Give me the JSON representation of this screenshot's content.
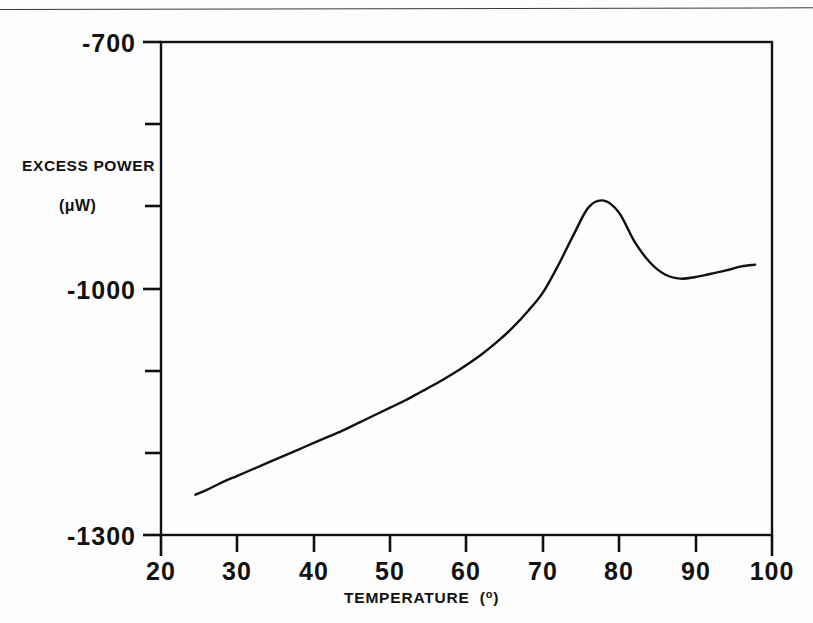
{
  "chart_data": {
    "type": "line",
    "title": "",
    "xlabel": "TEMPERATURE  (°)",
    "xlabel_main": "TEMPERATURE",
    "xlabel_unit_open": "(",
    "xlabel_unit_sup": "o",
    "xlabel_unit_close": ")",
    "ylabel": "EXCESS POWER",
    "ylabel_units": "(μW)",
    "xlim": [
      20,
      100
    ],
    "ylim": [
      -1300,
      -700
    ],
    "xticks": [
      20,
      30,
      40,
      50,
      60,
      70,
      80,
      90,
      100
    ],
    "xtick_labels": [
      "20",
      "30",
      "40",
      "50",
      "60",
      "70",
      "80",
      "90",
      "100"
    ],
    "yticks": [
      -700,
      -800,
      -900,
      -1000,
      -1100,
      -1200,
      -1300
    ],
    "ytick_labels": [
      "-700",
      "",
      "",
      "-1000",
      "",
      "",
      "-1300"
    ],
    "ytick_labels_shown": [
      "-700",
      "-1000",
      "-1300"
    ],
    "grid": false,
    "legend": false,
    "line_color": "#111111",
    "series": [
      {
        "name": "excess power",
        "x": [
          24.5,
          26,
          28,
          30,
          32,
          34,
          36,
          38,
          40,
          42,
          44,
          46,
          48,
          50,
          52,
          54,
          56,
          58,
          60,
          62,
          64,
          66,
          68,
          70,
          72,
          74,
          76,
          78,
          80,
          82,
          84,
          86,
          88,
          90,
          92,
          94,
          96,
          97.8
        ],
        "y": [
          -1251,
          -1245,
          -1236,
          -1228,
          -1220,
          -1212,
          -1204,
          -1196,
          -1188,
          -1180,
          -1172,
          -1163,
          -1154,
          -1145,
          -1136,
          -1126,
          -1116,
          -1105,
          -1093,
          -1080,
          -1065,
          -1048,
          -1028,
          -1005,
          -972,
          -935,
          -901,
          -893,
          -908,
          -943,
          -968,
          -983,
          -988,
          -986,
          -982,
          -978,
          -973,
          -971
        ]
      }
    ]
  },
  "axis_geometry": {
    "plot_left_px": 161,
    "plot_right_px": 772,
    "plot_top_px": 42,
    "plot_bottom_px": 535
  }
}
